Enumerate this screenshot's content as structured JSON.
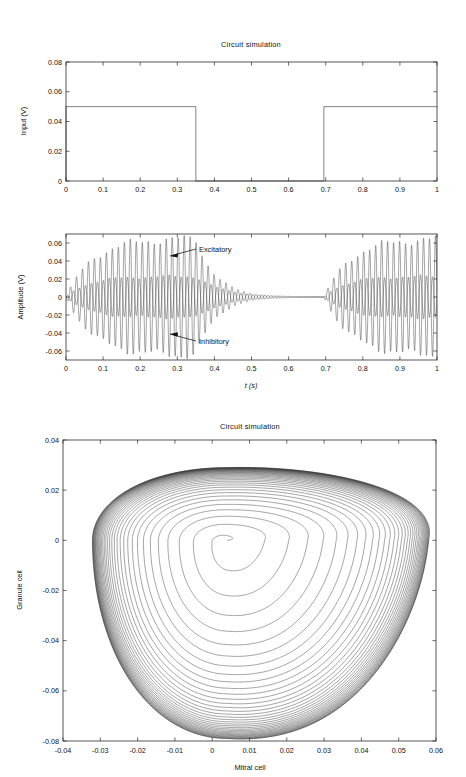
{
  "figure": {
    "background": "#ffffff",
    "line_color": "#1c1c1c"
  },
  "panels": {
    "input": {
      "title": "Circuit simulation",
      "ylabel": "Input (V)",
      "xlabel": "",
      "yticks": [
        "0",
        "0.02",
        "0.04",
        "0.06",
        "0.08"
      ],
      "xticks": [
        "0",
        "0.1",
        "0.2",
        "0.3",
        "0.4",
        "0.5",
        "0.6",
        "0.7",
        "0.8",
        "0.9",
        "1"
      ]
    },
    "amplitude": {
      "title": "",
      "ylabel": "Amplitude (V)",
      "xlabel": "t (s)",
      "yticks": [
        "-0.06",
        "-0.04",
        "-0.02",
        "0",
        "0.02",
        "0.04",
        "0.06"
      ],
      "xticks": [
        "0",
        "0.1",
        "0.2",
        "0.3",
        "0.4",
        "0.5",
        "0.6",
        "0.7",
        "0.8",
        "0.9",
        "1"
      ],
      "annotations": [
        {
          "label": "Excitatory"
        },
        {
          "label": "Inhibitory"
        }
      ]
    },
    "phase": {
      "title": "Circuit simulation",
      "ylabel": "Granule cell",
      "xlabel": "Mitral cell",
      "yticks": [
        "-0.08",
        "-0.06",
        "-0.04",
        "-0.02",
        "0",
        "0.02",
        "0.04"
      ],
      "xticks": [
        "-0.04",
        "-0.03",
        "-0.02",
        "-0.01",
        "0",
        "0.01",
        "0.02",
        "0.03",
        "0.04",
        "0.05",
        "0.06"
      ]
    }
  },
  "chart_data": [
    {
      "type": "line",
      "name": "input-square-wave",
      "title": "Circuit simulation",
      "xlabel": "",
      "ylabel": "Input (V)",
      "xlim": [
        0,
        1
      ],
      "ylim": [
        0,
        0.08
      ],
      "xticks": [
        0,
        0.1,
        0.2,
        0.3,
        0.4,
        0.5,
        0.6,
        0.7,
        0.8,
        0.9,
        1
      ],
      "yticks": [
        0,
        0.02,
        0.04,
        0.06,
        0.08
      ],
      "grid": false,
      "legend": "none",
      "series": [
        {
          "name": "Input",
          "x": [
            0,
            0,
            0.35,
            0.35,
            0.695,
            0.695,
            1
          ],
          "y": [
            0,
            0.05,
            0.05,
            0,
            0,
            0.05,
            0.05
          ]
        }
      ],
      "pulse_high": 0.05,
      "pulse_low": 0,
      "pulses": [
        [
          0,
          0.35
        ],
        [
          0.695,
          1
        ]
      ]
    },
    {
      "type": "line",
      "name": "amplitude-timeseries",
      "title": "",
      "xlabel": "t (s)",
      "ylabel": "Amplitude (V)",
      "xlim": [
        0,
        1
      ],
      "ylim": [
        -0.07,
        0.07
      ],
      "xticks": [
        0,
        0.1,
        0.2,
        0.3,
        0.4,
        0.5,
        0.6,
        0.7,
        0.8,
        0.9,
        1
      ],
      "yticks": [
        -0.06,
        -0.04,
        -0.02,
        0,
        0.02,
        0.04,
        0.06
      ],
      "grid": false,
      "legend": "annotations",
      "oscillation_frequency_hz": 62,
      "series": [
        {
          "name": "Inhibitory",
          "peak_amplitude": 0.065,
          "envelope_rise_s": 0.07,
          "decay_start_s": 0.35,
          "decay_tau_s": 0.055,
          "phase_offset_rad": 3.14159
        },
        {
          "name": "Excitatory",
          "peak_amplitude": 0.023,
          "envelope_rise_s": 0.06,
          "decay_start_s": 0.35,
          "decay_tau_s": 0.075,
          "phase_offset_rad": 0
        }
      ],
      "annotations": [
        {
          "text": "Excitatory",
          "x": 0.42,
          "y": 0.054
        },
        {
          "text": "Inhibitory",
          "x": 0.42,
          "y": -0.046
        }
      ]
    },
    {
      "type": "line",
      "name": "phase-portrait",
      "title": "Circuit simulation",
      "xlabel": "Mitral cell",
      "ylabel": "Granule cell",
      "xlim": [
        -0.04,
        0.06
      ],
      "ylim": [
        -0.08,
        0.04
      ],
      "xticks": [
        -0.04,
        -0.03,
        -0.02,
        -0.01,
        0,
        0.01,
        0.02,
        0.03,
        0.04,
        0.05,
        0.06
      ],
      "yticks": [
        -0.08,
        -0.06,
        -0.04,
        -0.02,
        0,
        0.02,
        0.04
      ],
      "grid": false,
      "legend": "none",
      "description": "Spiral trajectory expanding from a focus to a limit cycle",
      "focus": [
        0.004,
        0.0
      ],
      "limit_cycle_extent": {
        "xmin": -0.034,
        "xmax": 0.058,
        "ymin": -0.079,
        "ymax": 0.029
      },
      "turns": 34
    }
  ]
}
